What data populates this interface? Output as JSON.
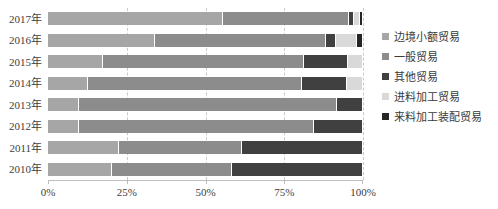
{
  "chart_data": {
    "type": "bar",
    "orientation": "horizontal",
    "stacked": true,
    "normalized": true,
    "title": "",
    "xlabel": "",
    "ylabel": "",
    "xlim": [
      0,
      100
    ],
    "grid": true,
    "legend_position": "right",
    "categories": [
      "2010年",
      "2011年",
      "2012年",
      "2013年",
      "2014年",
      "2015年",
      "2016年",
      "2017年"
    ],
    "xticks": [
      0,
      25,
      50,
      75,
      100
    ],
    "xticklabels": [
      "0%",
      "25%",
      "50%",
      "75%",
      "100%"
    ],
    "series": [
      {
        "name": "边境小额贸易",
        "color": "#a6a6a6",
        "values": [
          20.3,
          22.5,
          9.8,
          9.8,
          12.7,
          17.5,
          34.0,
          55.6
        ]
      },
      {
        "name": "一般贸易",
        "color": "#8c8c8c",
        "values": [
          38.1,
          39.1,
          74.6,
          81.9,
          67.9,
          63.8,
          54.1,
          40.0
        ]
      },
      {
        "name": "其他贸易",
        "color": "#404040",
        "values": [
          41.6,
          38.4,
          15.6,
          8.3,
          14.3,
          14.0,
          3.2,
          1.6
        ]
      },
      {
        "name": "进料加工贸易",
        "color": "#d9d9d9",
        "values": [
          0.0,
          0.0,
          0.0,
          0.0,
          5.1,
          4.7,
          6.7,
          1.9
        ]
      },
      {
        "name": "来料加工装配贸易",
        "color": "#262626",
        "values": [
          0.0,
          0.0,
          0.0,
          0.0,
          0.0,
          0.0,
          2.0,
          0.9
        ]
      }
    ]
  },
  "legend": {
    "items": [
      {
        "label": "边境小额贸易",
        "color": "#a6a6a6"
      },
      {
        "label": "一般贸易",
        "color": "#8c8c8c"
      },
      {
        "label": "其他贸易",
        "color": "#404040"
      },
      {
        "label": "进料加工贸易",
        "color": "#d9d9d9"
      },
      {
        "label": "来料加工装配贸易",
        "color": "#262626"
      }
    ]
  }
}
